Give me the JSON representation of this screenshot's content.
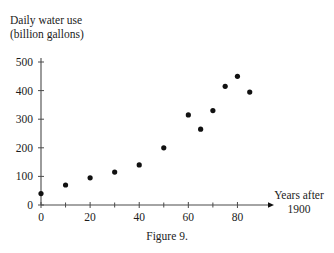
{
  "caption": "Figure 9.",
  "chart_data": {
    "type": "scatter",
    "title": "",
    "ylabel": "Daily water use (billion gallons)",
    "ylabel_lines": [
      "Daily water use",
      "(billion gallons)"
    ],
    "xlabel": "Years after 1900",
    "xlabel_lines": [
      "Years after",
      "1900"
    ],
    "x": [
      0,
      10,
      20,
      30,
      40,
      50,
      60,
      65,
      70,
      75,
      80,
      85
    ],
    "y": [
      40,
      70,
      95,
      115,
      140,
      200,
      315,
      265,
      330,
      415,
      450,
      395
    ],
    "points": [
      {
        "x": 0,
        "y": 40
      },
      {
        "x": 10,
        "y": 70
      },
      {
        "x": 20,
        "y": 95
      },
      {
        "x": 30,
        "y": 115
      },
      {
        "x": 40,
        "y": 140
      },
      {
        "x": 50,
        "y": 200
      },
      {
        "x": 60,
        "y": 315
      },
      {
        "x": 65,
        "y": 265
      },
      {
        "x": 70,
        "y": 330
      },
      {
        "x": 75,
        "y": 415
      },
      {
        "x": 80,
        "y": 450
      },
      {
        "x": 85,
        "y": 395
      }
    ],
    "xlim": [
      0,
      90
    ],
    "ylim": [
      0,
      520
    ],
    "xticks": [
      0,
      20,
      40,
      60,
      80
    ],
    "xticklabels": [
      "0",
      "20",
      "40",
      "60",
      "80"
    ],
    "xminorticks": [
      10,
      30,
      50,
      70
    ],
    "yticks": [
      0,
      100,
      200,
      300,
      400,
      500
    ],
    "yticklabels": [
      "0",
      "100",
      "200",
      "300",
      "400",
      "500"
    ],
    "grid": false,
    "legend": null,
    "marker_color": "#111111",
    "axis_color": "#4a4a4a",
    "background_color": "#ffffff"
  }
}
